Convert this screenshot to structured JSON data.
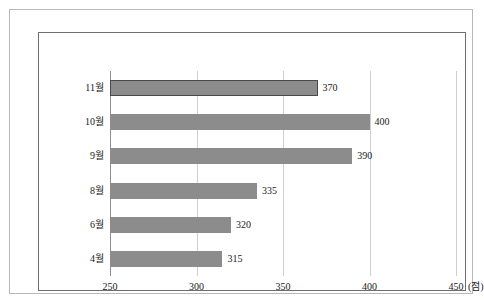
{
  "chart_data": {
    "type": "bar",
    "orientation": "horizontal",
    "title": "",
    "subtitle": "",
    "xlabel": "(점)",
    "ylabel": "",
    "categories": [
      "11월",
      "10월",
      "9월",
      "8월",
      "6월",
      "4월"
    ],
    "values": [
      370,
      400,
      390,
      335,
      320,
      315
    ],
    "series": [
      {
        "name": "",
        "values": [
          370,
          400,
          390,
          335,
          320,
          315
        ]
      }
    ],
    "data_labels": [
      "370",
      "400",
      "390",
      "335",
      "320",
      "315"
    ],
    "xlim": [
      250,
      450
    ],
    "xticks": [
      250,
      300,
      350,
      400,
      450
    ],
    "xtick_labels": [
      "250",
      "300",
      "350",
      "400",
      "450"
    ],
    "axis_unit_label": "(점)",
    "grid": true,
    "grid_axis": "x",
    "legend": false,
    "legend_position": "none",
    "bar_color": "#8c8c8c",
    "bar_outline_color": "#4a4a4a",
    "gridline_color": "#cfcfcf",
    "axis_color": "#8f8f8f",
    "text_color": "#1a1a1a",
    "background_color": "#ffffff",
    "outer_frame_color": "#b8b8b8",
    "inner_frame_color": "#6e6e6e",
    "bars": [
      {
        "category": "11월",
        "value": 370,
        "label": "370",
        "outlined": true
      },
      {
        "category": "10월",
        "value": 400,
        "label": "400",
        "outlined": false
      },
      {
        "category": "9월",
        "value": 390,
        "label": "390",
        "outlined": false
      },
      {
        "category": "8월",
        "value": 335,
        "label": "335",
        "outlined": false
      },
      {
        "category": "6월",
        "value": 320,
        "label": "320",
        "outlined": false
      },
      {
        "category": "4월",
        "value": 315,
        "label": "315",
        "outlined": false
      }
    ]
  }
}
